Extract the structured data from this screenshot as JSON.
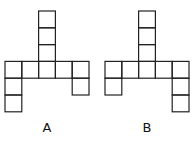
{
  "figures": [
    {
      "label": "A",
      "offset_x": 5,
      "cells": [
        [
          2,
          0
        ],
        [
          2,
          1
        ],
        [
          2,
          2
        ],
        [
          0,
          3
        ],
        [
          1,
          3
        ],
        [
          2,
          3
        ],
        [
          3,
          3
        ],
        [
          4,
          3
        ],
        [
          0,
          4
        ],
        [
          0,
          5
        ],
        [
          4,
          4
        ]
      ],
      "label_x": 38
    },
    {
      "label": "B",
      "offset_x": 105,
      "cells": [
        [
          2,
          0
        ],
        [
          2,
          1
        ],
        [
          2,
          2
        ],
        [
          0,
          3
        ],
        [
          1,
          3
        ],
        [
          2,
          3
        ],
        [
          3,
          3
        ],
        [
          4,
          3
        ],
        [
          0,
          4
        ],
        [
          4,
          4
        ],
        [
          4,
          5
        ]
      ],
      "label_x": 138
    }
  ],
  "cell_size": 16.8,
  "offset_y": 11,
  "stroke_color": "#222222"
}
